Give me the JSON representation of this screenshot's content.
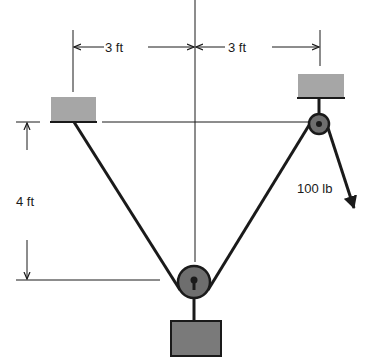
{
  "diagram": {
    "type": "statics-pulley-system",
    "labels": {
      "left_span": "3 ft",
      "right_span": "3 ft",
      "height": "4 ft",
      "force": "100 lb"
    },
    "colors": {
      "line": "#1a1a1a",
      "support_fill": "#a6a6a6",
      "weight_fill": "#7a7a7a",
      "pulley_fill": "#6e6e6e"
    }
  }
}
